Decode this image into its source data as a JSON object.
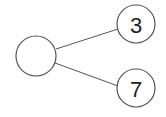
{
  "diagram": {
    "type": "tree",
    "root": {
      "label": ""
    },
    "children": [
      {
        "label": "3"
      },
      {
        "label": "7"
      }
    ],
    "colors": {
      "stroke": "#555555",
      "fill": "#ffffff",
      "text": "#222222"
    }
  }
}
